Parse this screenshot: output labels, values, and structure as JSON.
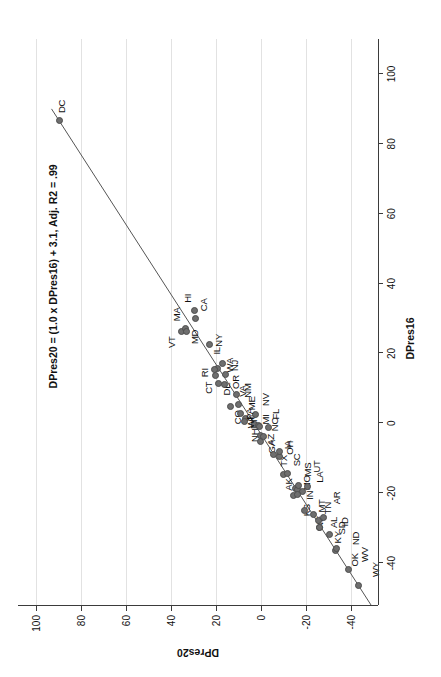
{
  "figure": {
    "annotation": "DPres20 = (1.0 x DPres16) + 3.1, Adj. R2 = .99",
    "point_color": "#6e6e6e",
    "line_color": "#555555",
    "grid_color": "#e2e2e2"
  },
  "chart_data": {
    "type": "scatter",
    "title": "",
    "subtitle": "",
    "xlabel": "DPres16",
    "ylabel": "DPres20",
    "xlim": [
      -52,
      110
    ],
    "ylim": [
      -52,
      108
    ],
    "xticks": [
      -40,
      -20,
      0,
      20,
      40,
      60,
      80,
      100
    ],
    "yticks": [
      -40,
      -20,
      0,
      20,
      40,
      60,
      80,
      100
    ],
    "xticklabels": [
      "-40",
      "-20",
      "0",
      "20",
      "40",
      "60",
      "80",
      "100"
    ],
    "yticklabels": [
      "-40",
      "-20",
      "0",
      "20",
      "40",
      "60",
      "80",
      "100"
    ],
    "grid": "horizontal-gridlines-on-y",
    "legend": "none",
    "annotations": [
      {
        "text": "DPres20 = (1.0 x DPres16) + 3.1, Adj. R2 = .99",
        "x": 10,
        "y": 95
      }
    ],
    "fit_line": {
      "slope": 1.0,
      "intercept": 3.1,
      "adj_r2": 0.99,
      "x_start": -52,
      "x_end": 90
    },
    "point_labels_field": "label",
    "points": [
      {
        "label": "DC",
        "x": 86.8,
        "y": 89.6,
        "lx": 7,
        "ly": 3
      },
      {
        "label": "VT",
        "x": 26.4,
        "y": 35.4,
        "lx": -17,
        "ly": -9
      },
      {
        "label": "MA",
        "x": 27.2,
        "y": 33.5,
        "lx": 7,
        "ly": -9
      },
      {
        "label": "MD",
        "x": 26.4,
        "y": 33.2,
        "lx": -13,
        "ly": 9
      },
      {
        "label": "NY",
        "x": 22.5,
        "y": 23.1,
        "lx": -2,
        "ly": 10
      },
      {
        "label": "CA",
        "x": 30.1,
        "y": 29.2,
        "lx": 7,
        "ly": 9
      },
      {
        "label": "HI",
        "x": 32.2,
        "y": 29.5,
        "lx": 8,
        "ly": -7
      },
      {
        "label": "WA",
        "x": 15.7,
        "y": 19.2,
        "lx": -4,
        "ly": 12
      },
      {
        "label": "IL",
        "x": 17.1,
        "y": 17.0,
        "lx": 9,
        "ly": -6
      },
      {
        "label": "NJ",
        "x": 14.1,
        "y": 15.9,
        "lx": 3,
        "ly": 10
      },
      {
        "label": "NM",
        "x": 8.2,
        "y": 10.8,
        "lx": -3,
        "ly": 11
      },
      {
        "label": "RI",
        "x": 15.5,
        "y": 20.8,
        "lx": -8,
        "ly": -9
      },
      {
        "label": "CT",
        "x": 13.6,
        "y": 20.1,
        "lx": -18,
        "ly": -7
      },
      {
        "label": "DE",
        "x": 11.4,
        "y": 19.0,
        "lx": -12,
        "ly": 9
      },
      {
        "label": "OR",
        "x": 11.0,
        "y": 16.1,
        "lx": -4,
        "ly": 11
      },
      {
        "label": "CO",
        "x": 4.9,
        "y": 13.5,
        "lx": -18,
        "ly": 7
      },
      {
        "label": "MN",
        "x": 1.5,
        "y": 7.1,
        "lx": -11,
        "ly": 9
      },
      {
        "label": "VA",
        "x": 5.3,
        "y": 10.1,
        "lx": 8,
        "ly": 5
      },
      {
        "label": "ME",
        "x": 2.9,
        "y": 9.1,
        "lx": 3,
        "ly": 11
      },
      {
        "label": "NH",
        "x": 0.4,
        "y": 7.4,
        "lx": -20,
        "ly": 11
      },
      {
        "label": "MI",
        "x": -0.3,
        "y": 2.8,
        "lx": 0,
        "ly": 11
      },
      {
        "label": "NV",
        "x": 2.4,
        "y": 2.4,
        "lx": 9,
        "ly": 10
      },
      {
        "label": "AZ",
        "x": -3.5,
        "y": 0.3,
        "lx": -10,
        "ly": 11
      },
      {
        "label": "PA",
        "x": -0.7,
        "y": 1.2,
        "lx": 6,
        "ly": -8
      },
      {
        "label": "WI",
        "x": -0.8,
        "y": 0.6,
        "lx": -2,
        "ly": -9
      },
      {
        "label": "FL",
        "x": -1.2,
        "y": -3.4,
        "lx": 8,
        "ly": 7
      },
      {
        "label": "GA",
        "x": -5.2,
        "y": 0.2,
        "lx": -12,
        "ly": 11
      },
      {
        "label": "NC",
        "x": -3.7,
        "y": -1.3,
        "lx": 5,
        "ly": 11
      },
      {
        "label": "TX",
        "x": -9.0,
        "y": -5.6,
        "lx": -12,
        "ly": 10
      },
      {
        "label": "IA",
        "x": -9.4,
        "y": -8.2,
        "lx": 7,
        "ly": 9
      },
      {
        "label": "OH",
        "x": -8.1,
        "y": -8.0,
        "lx": -3,
        "ly": 11
      },
      {
        "label": "AK",
        "x": -14.7,
        "y": -10.1,
        "lx": -16,
        "ly": 5
      },
      {
        "label": "SC",
        "x": -14.3,
        "y": -11.7,
        "lx": 7,
        "ly": 10
      },
      {
        "label": "MO",
        "x": -18.6,
        "y": -15.4,
        "lx": -2,
        "ly": 11
      },
      {
        "label": "IN",
        "x": -19.0,
        "y": -16.1,
        "lx": -10,
        "ly": 13
      },
      {
        "label": "KS",
        "x": -20.6,
        "y": -14.6,
        "lx": -21,
        "ly": 13
      },
      {
        "label": "MS",
        "x": -17.8,
        "y": -16.5,
        "lx": 9,
        "ly": 10
      },
      {
        "label": "UT",
        "x": -18.1,
        "y": -20.5,
        "lx": 14,
        "ly": 10
      },
      {
        "label": "LA",
        "x": -19.6,
        "y": -18.6,
        "lx": 9,
        "ly": 17
      },
      {
        "label": "TN",
        "x": -26.0,
        "y": -23.2,
        "lx": 0,
        "ly": 15
      },
      {
        "label": "NE",
        "x": -25.0,
        "y": -19.2,
        "lx": -18,
        "ly": 16
      },
      {
        "label": "AL",
        "x": -27.7,
        "y": -25.5,
        "lx": -8,
        "ly": 16
      },
      {
        "label": "MT",
        "x": -20.4,
        "y": -16.4,
        "lx": -18,
        "ly": 24
      },
      {
        "label": "KY",
        "x": -29.8,
        "y": -26.0,
        "lx": -16,
        "ly": 18
      },
      {
        "label": "AR",
        "x": -26.9,
        "y": -27.6,
        "lx": 13,
        "ly": 14
      },
      {
        "label": "SD",
        "x": -29.8,
        "y": -26.2,
        "lx": -7,
        "ly": 22
      },
      {
        "label": "ID",
        "x": -31.8,
        "y": -30.6,
        "lx": 8,
        "ly": 15
      },
      {
        "label": "OK",
        "x": -36.4,
        "y": -33.1,
        "lx": -16,
        "ly": 20
      },
      {
        "label": "ND",
        "x": -35.7,
        "y": -33.4,
        "lx": 3,
        "ly": 20
      },
      {
        "label": "WV",
        "x": -41.7,
        "y": -38.9,
        "lx": 7,
        "ly": 16
      },
      {
        "label": "WY",
        "x": -46.3,
        "y": -43.4,
        "lx": 8,
        "ly": 17
      }
    ]
  }
}
